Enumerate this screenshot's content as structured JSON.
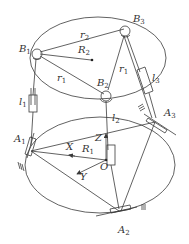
{
  "diagram": {
    "type": "3-RPS parallel mechanism schematic",
    "colors": {
      "line": "#3a3a3a",
      "text": "#333333",
      "background": "#ffffff"
    },
    "moving_platform": {
      "joints": [
        {
          "id": "B1",
          "letter": "B",
          "sub": "1"
        },
        {
          "id": "B2",
          "letter": "B",
          "sub": "2"
        },
        {
          "id": "B3",
          "letter": "B",
          "sub": "3"
        }
      ],
      "edge_labels": [
        {
          "letter": "r",
          "sub": "2"
        },
        {
          "letter": "r",
          "sub": "1"
        },
        {
          "letter": "r",
          "sub": "1"
        }
      ],
      "radius_label": {
        "letter": "R",
        "sub": "2"
      }
    },
    "legs": [
      {
        "letter": "l",
        "sub": "1"
      },
      {
        "letter": "l",
        "sub": "2"
      },
      {
        "letter": "l",
        "sub": "3"
      }
    ],
    "base_platform": {
      "joints": [
        {
          "id": "A1",
          "letter": "A",
          "sub": "1"
        },
        {
          "id": "A2",
          "letter": "A",
          "sub": "2"
        },
        {
          "id": "A3",
          "letter": "A",
          "sub": "3"
        }
      ],
      "radius_label": {
        "letter": "R",
        "sub": "1"
      }
    },
    "axes": {
      "x": "X",
      "y": "Y",
      "z": "Z",
      "origin": "O"
    }
  }
}
